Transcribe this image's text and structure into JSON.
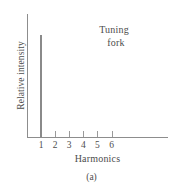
{
  "figure": {
    "caption": "(a)",
    "annotation_line1": "Tuning",
    "annotation_line2": "fork"
  },
  "chart_data": {
    "type": "bar",
    "title": "",
    "annotation": "Tuning fork",
    "categories": [
      "1",
      "2",
      "3",
      "4",
      "5",
      "6"
    ],
    "values": [
      1.0,
      0.0,
      0.0,
      0.0,
      0.0,
      0.0
    ],
    "xlabel": "Harmonics",
    "ylabel": "Relative intensity",
    "xlim": [
      0.4,
      10.0
    ],
    "ylim": [
      0,
      1.2
    ],
    "grid": false,
    "legend": null,
    "axis_ticks_y_labeled": false,
    "bar_color": "#8a8a8a",
    "axis_color": "#8d8d8d"
  }
}
